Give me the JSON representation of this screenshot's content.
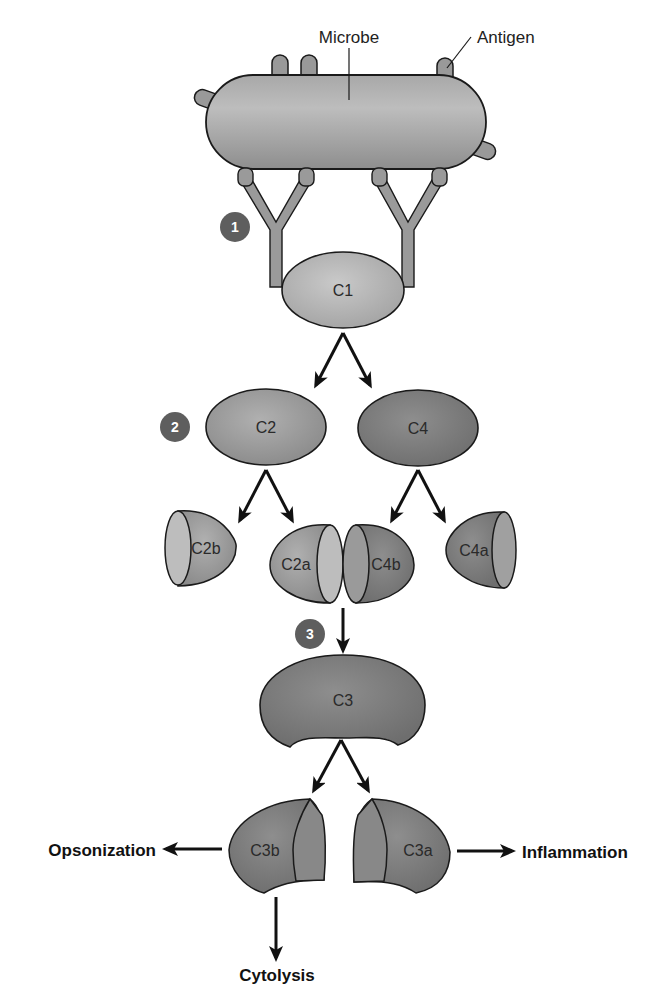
{
  "labels": {
    "microbe": "Microbe",
    "antigen": "Antigen"
  },
  "steps": [
    "1",
    "2",
    "3"
  ],
  "components": {
    "c1": "C1",
    "c2": "C2",
    "c4": "C4",
    "c2b": "C2b",
    "c2a": "C2a",
    "c4b": "C4b",
    "c4a": "C4a",
    "c3": "C3",
    "c3b": "C3b",
    "c3a": "C3a"
  },
  "outcomes": {
    "opsonization": "Opsonization",
    "inflammation": "Inflammation",
    "cytolysis": "Cytolysis"
  },
  "colors": {
    "light": "#b8b8b8",
    "mid": "#9a9a9a",
    "dark": "#7a7a7a",
    "darker": "#6a6a6a",
    "step_badge": "#5e5e5e",
    "outline": "#1a1a1a"
  }
}
